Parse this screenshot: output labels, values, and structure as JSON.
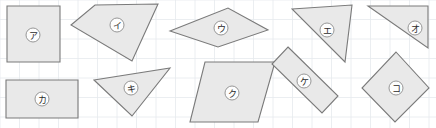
{
  "figure": {
    "canvas": {
      "width": 436,
      "height": 128
    },
    "background_color": "#ffffff",
    "grid": {
      "visible": true,
      "color": "#e6eaee",
      "spacing_px": 19.5
    },
    "shape_style": {
      "fill": "#e9e9e9",
      "stroke": "#7a7a7a",
      "label_fill": "#fdfdfd",
      "label_stroke": "#8c8c8c",
      "label_text_color": "#2b2b2b"
    }
  },
  "shapes": [
    {
      "label": "ア",
      "kind": "square",
      "points": "7,6 60,6 60,62 7,62",
      "label_pos": {
        "x": 33,
        "y": 35
      }
    },
    {
      "label": "イ",
      "kind": "quadrilateral",
      "points": "95,5 158,4 132,61 71,25",
      "label_pos": {
        "x": 117,
        "y": 25
      }
    },
    {
      "label": "ウ",
      "kind": "rhombus",
      "points": "170,31 228,8 268,30 218,47",
      "label_pos": {
        "x": 221,
        "y": 28
      }
    },
    {
      "label": "エ",
      "kind": "triangle",
      "points": "292,9 352,5 345,62",
      "label_pos": {
        "x": 327,
        "y": 30
      }
    },
    {
      "label": "オ",
      "kind": "right-triangle",
      "points": "368,6 428,6 428,48",
      "label_pos": {
        "x": 415,
        "y": 28
      }
    },
    {
      "label": "カ",
      "kind": "rectangle",
      "points": "6,80 78,80 78,118 6,118",
      "label_pos": {
        "x": 42,
        "y": 99
      }
    },
    {
      "label": "キ",
      "kind": "triangle",
      "points": "94,80 170,68 132,116",
      "label_pos": {
        "x": 131,
        "y": 88
      }
    },
    {
      "label": "ク",
      "kind": "parallelogram",
      "points": "205,62 275,62 258,122 190,122",
      "label_pos": {
        "x": 232,
        "y": 93
      }
    },
    {
      "label": "ケ",
      "kind": "rotated-rectangle",
      "points": "288,47 338,96 322,113 272,64",
      "label_pos": {
        "x": 304,
        "y": 81
      }
    },
    {
      "label": "コ",
      "kind": "diamond",
      "points": "396,52 429,88 395,122 362,88",
      "label_pos": {
        "x": 396,
        "y": 88
      }
    }
  ]
}
